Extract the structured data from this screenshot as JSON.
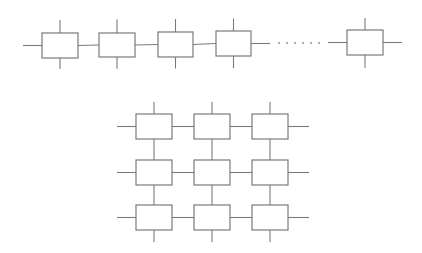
{
  "colors": {
    "line": "#7a7a7a",
    "dot": "#8a8a8a",
    "background": "#ffffff",
    "box_fill": "#ffffff"
  },
  "top_chain": {
    "description": "1D chain of nodes with ellipsis",
    "y_center": 44,
    "stub_top": 20,
    "stub_bottom": 69,
    "boxes": [
      {
        "x": 42,
        "y": 33,
        "w": 36,
        "h": 25
      },
      {
        "x": 99,
        "y": 33,
        "w": 36,
        "h": 24
      },
      {
        "x": 158,
        "y": 32,
        "w": 35,
        "h": 25
      },
      {
        "x": 216,
        "y": 31,
        "w": 35,
        "h": 25
      },
      {
        "x": 347,
        "y": 30,
        "w": 36,
        "h": 25
      }
    ],
    "left_wire_start": 23,
    "after_fourth_wire_end": 270,
    "before_last_wire_start": 328,
    "right_wire_end": 402,
    "ellipsis_dots": [
      279,
      287,
      295,
      303,
      311,
      319
    ]
  },
  "grid": {
    "description": "3x3 mesh of nodes",
    "cols_x": [
      136,
      194,
      252
    ],
    "rows_y": [
      114,
      160,
      205
    ],
    "box_w": 36,
    "box_h": 25,
    "left_wire_start": 117,
    "right_wire_end": 309,
    "top_wire_start": 102,
    "bottom_wire_end": 242
  }
}
